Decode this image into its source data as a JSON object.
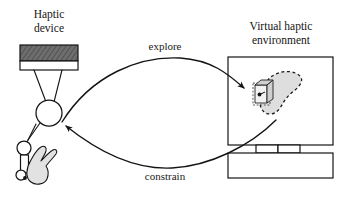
{
  "figure": {
    "background_color": "#ffffff",
    "ink_color": "#141414",
    "width": 343,
    "height": 200
  },
  "labels": {
    "haptic_device_line1": "Haptic",
    "haptic_device_line2": "device",
    "virtual_env_line1": "Virtual haptic",
    "virtual_env_line2": "environment",
    "explore": "explore",
    "constrain": "constrain"
  },
  "haptic_device": {
    "base_block_fill": "#6e6e6e",
    "base_plate_fill": "#ffffff",
    "link_color": "#141414",
    "joint_fill": "#ffffff",
    "hand_fill": "#e2e2e2",
    "stylus_fill": "#ffffff"
  },
  "virtual_environment": {
    "monitor_frame_fill": "#ffffff",
    "monitor_stand_fill": "#ffffff",
    "monitor_base_fill": "#ffffff",
    "virtual_object_fill": "#dedede",
    "virtual_object_outline": "dashed",
    "cursor_front_fill": "#f2f2f2",
    "cursor_side_fill": "#cfcfcf"
  },
  "flows": [
    {
      "name": "explore",
      "label": "explore",
      "from": "haptic-device",
      "to": "virtual-haptic-environment",
      "direction": "left-to-right"
    },
    {
      "name": "constrain",
      "label": "constrain",
      "from": "virtual-haptic-environment",
      "to": "haptic-device",
      "direction": "right-to-left"
    }
  ]
}
